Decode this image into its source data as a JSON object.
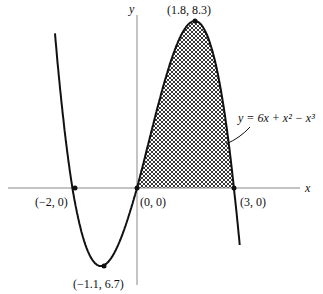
{
  "axes": {
    "x_label": "x",
    "y_label": "y"
  },
  "points": [
    {
      "label": "(−2, 0)",
      "x": -2,
      "y": 0
    },
    {
      "label": "(0, 0)",
      "x": 0,
      "y": 0
    },
    {
      "label": "(3, 0)",
      "x": 3,
      "y": 0
    },
    {
      "label": "(1.8, 8.3)",
      "x": 1.8,
      "y": 8.3
    },
    {
      "label": "(−1.1, 6.7)",
      "x": -1.1,
      "y": -4.1
    }
  ],
  "equation": {
    "label": "y = 6x + x² − x³"
  },
  "shaded_region": {
    "from_x": 0,
    "to_x": 3,
    "pattern": "crosshatch"
  },
  "colors": {
    "curve": "#111111",
    "axis": "#888888",
    "hatch": "#222222"
  }
}
